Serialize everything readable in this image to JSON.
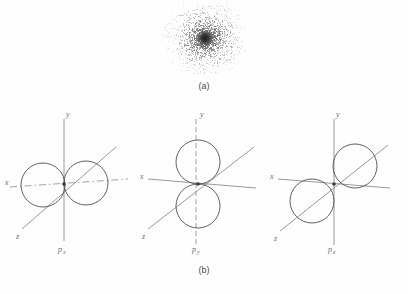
{
  "figure": {
    "panel_a": {
      "caption": "(a)",
      "depiction": "electron-probability-density-dot-cloud",
      "cloud": {
        "center_x": 50,
        "center_y": 36,
        "nucleus_radius": 3.4,
        "max_radius": 44,
        "dot_count": 2600,
        "dot_color": "#6b6b6b",
        "nucleus_color": "#1a1a1a"
      }
    },
    "panel_b": {
      "caption": "(b)",
      "orbitals": [
        {
          "name": "p-x-orbital",
          "label": "p",
          "subscript": "x",
          "lobe_axis": "x",
          "dashed_axis": "x",
          "axes": [
            {
              "name": "y",
              "label": "y",
              "style": "solid",
              "orientation": "vertical"
            },
            {
              "name": "x",
              "label": "x",
              "style": "dashdot",
              "orientation": "horizontal"
            },
            {
              "name": "z",
              "label": "z",
              "style": "solid",
              "orientation": "diagonal"
            }
          ]
        },
        {
          "name": "p-y-orbital",
          "label": "p",
          "subscript": "y",
          "lobe_axis": "y",
          "dashed_axis": "y",
          "axes": [
            {
              "name": "y",
              "label": "y",
              "style": "dashed",
              "orientation": "vertical"
            },
            {
              "name": "x",
              "label": "x",
              "style": "solid",
              "orientation": "horizontal"
            },
            {
              "name": "z",
              "label": "z",
              "style": "solid",
              "orientation": "diagonal"
            }
          ]
        },
        {
          "name": "p-z-orbital",
          "label": "p",
          "subscript": "z",
          "lobe_axis": "z",
          "dashed_axis": "none",
          "axes": [
            {
              "name": "y",
              "label": "y",
              "style": "solid",
              "orientation": "vertical"
            },
            {
              "name": "x",
              "label": "x",
              "style": "solid",
              "orientation": "horizontal"
            },
            {
              "name": "z",
              "label": "z",
              "style": "solid",
              "orientation": "diagonal"
            }
          ]
        }
      ]
    },
    "colors": {
      "background": "#fefefe",
      "axis": "#7d7d7d",
      "lobe": "#4f4f4f",
      "text": "#6e6e6e",
      "caption": "#4a4a4a"
    }
  }
}
